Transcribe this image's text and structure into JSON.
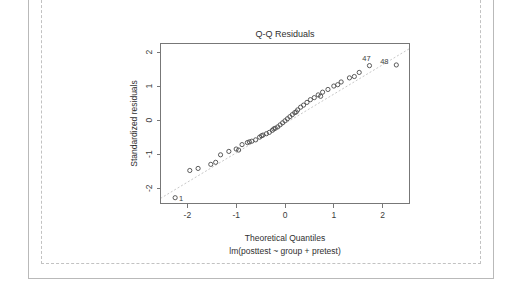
{
  "frame": {
    "outer_border_color": "#b9b9b9",
    "inner_border_color": "#c2c2c2"
  },
  "chart_data": {
    "type": "scatter",
    "title": "Q-Q Residuals",
    "subtitle": "lm(posttest ~ group + pretest)",
    "xlabel": "Theoretical Quantiles",
    "ylabel": "Standardized residuals",
    "xlim": [
      -2.55,
      2.55
    ],
    "ylim": [
      -2.45,
      2.25
    ],
    "xticks": [
      -2,
      -1,
      0,
      1,
      2
    ],
    "xticklabels": [
      "-2",
      "-1",
      "0",
      "1",
      "2"
    ],
    "yticks": [
      -2,
      -1,
      0,
      1,
      2
    ],
    "yticklabels": [
      "-2",
      "-1",
      "0",
      "1",
      "2"
    ],
    "grid": false,
    "legend": null,
    "reference_line": {
      "style": "dotted",
      "color": "#c8c8c8",
      "x": [
        -2.55,
        2.55
      ],
      "y": [
        -2.3,
        2.1
      ]
    },
    "marker": {
      "shape": "open-circle",
      "color": "#4a4a4a",
      "radius": 2.1
    },
    "point_labels": [
      {
        "text": "1",
        "x": -2.25,
        "y": -2.28,
        "dx": 6,
        "dy": 3
      },
      {
        "text": "47",
        "x": 1.73,
        "y": 1.6,
        "dx": -3,
        "dy": -5
      },
      {
        "text": "48",
        "x": 2.28,
        "y": 1.62,
        "dx": -12,
        "dy": -1
      }
    ],
    "x": [
      -2.25,
      -1.78,
      -1.52,
      -1.32,
      -1.15,
      -1.0,
      -0.88,
      -0.77,
      -0.68,
      -0.6,
      -0.52,
      -0.45,
      -0.38,
      -0.32,
      -0.26,
      -0.2,
      -0.15,
      -0.1,
      -0.05,
      0.0,
      0.05,
      0.1,
      0.15,
      0.2,
      0.26,
      0.32,
      0.38,
      0.45,
      0.52,
      0.6,
      0.68,
      0.77,
      0.88,
      1.0,
      1.15,
      1.32,
      1.52,
      1.73,
      2.28,
      -1.95,
      -1.42,
      -0.95,
      -0.73,
      -0.48,
      -0.23,
      0.23,
      0.73,
      1.08,
      1.42
    ],
    "y": [
      -2.28,
      -1.42,
      -1.3,
      -1.02,
      -0.92,
      -0.85,
      -0.72,
      -0.66,
      -0.62,
      -0.58,
      -0.5,
      -0.44,
      -0.4,
      -0.36,
      -0.3,
      -0.24,
      -0.2,
      -0.14,
      -0.08,
      -0.02,
      0.04,
      0.1,
      0.16,
      0.22,
      0.3,
      0.38,
      0.44,
      0.52,
      0.6,
      0.66,
      0.74,
      0.82,
      0.9,
      1.0,
      1.12,
      1.24,
      1.4,
      1.6,
      1.62,
      -1.48,
      -1.24,
      -0.88,
      -0.64,
      -0.46,
      -0.26,
      0.24,
      0.7,
      1.04,
      1.28
    ]
  }
}
